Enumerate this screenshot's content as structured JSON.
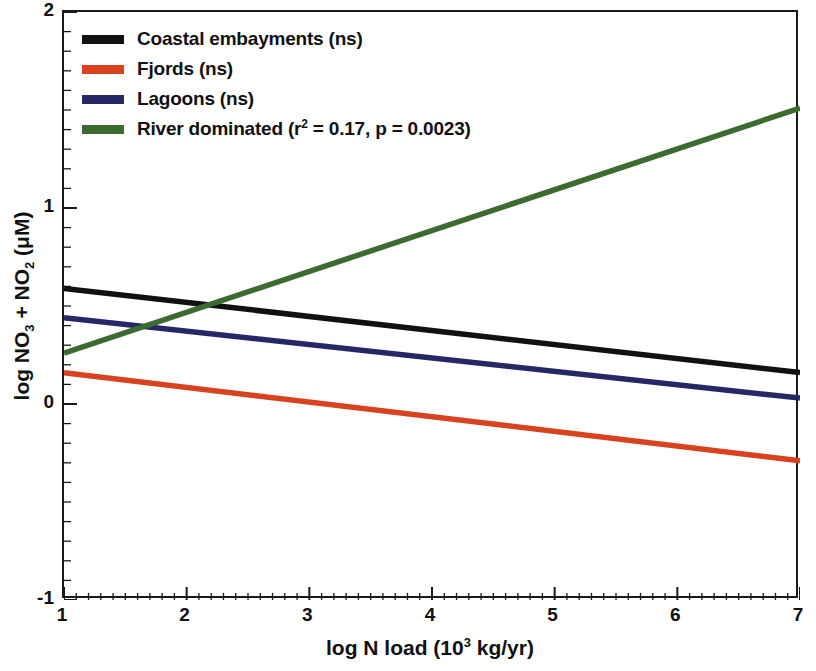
{
  "chart_data": {
    "type": "line",
    "title": "",
    "xlabel": "log N load (10^3 kg/yr)",
    "ylabel": "log NO3 + NO2 (uM)",
    "xlim": [
      1,
      7
    ],
    "ylim": [
      -1,
      2
    ],
    "xticks": [
      "1",
      "2",
      "3",
      "4",
      "5",
      "6",
      "7"
    ],
    "yticks": [
      "-1",
      "0",
      "1",
      "2"
    ],
    "xtick_values": [
      1,
      2,
      3,
      4,
      5,
      6,
      7
    ],
    "ytick_values": [
      -1,
      0,
      1,
      2
    ],
    "grid": false,
    "legend_position": "top-left",
    "minor_ticks_per_major_x": 10,
    "minor_ticks_per_major_y": 10,
    "series": [
      {
        "name": "Coastal embayments (ns)",
        "color": "#111111",
        "x": [
          1,
          7
        ],
        "values": [
          0.59,
          0.16
        ],
        "slope": -0.0717,
        "intercept": 0.6617
      },
      {
        "name": "Fjords (ns)",
        "color": "#d8421f",
        "x": [
          1,
          7
        ],
        "values": [
          0.16,
          -0.29
        ],
        "slope": -0.075,
        "intercept": 0.235
      },
      {
        "name": "Lagoons (ns)",
        "color": "#272766",
        "x": [
          1,
          7
        ],
        "values": [
          0.44,
          0.03
        ],
        "slope": -0.0683,
        "intercept": 0.5083
      },
      {
        "name": "River dominated (r^2 = 0.17, p = 0.0023)",
        "color": "#3c6b30",
        "x": [
          1,
          7
        ],
        "values": [
          0.26,
          1.51
        ],
        "slope": 0.2083,
        "intercept": 0.0517
      }
    ]
  },
  "legend": {
    "items": [
      {
        "label": "Coastal embayments (ns)",
        "color": "#111111",
        "has_superscript": false,
        "text_before": "Coastal embayments (ns)",
        "superscript": "",
        "text_after": ""
      },
      {
        "label": "Fjords (ns)",
        "color": "#d8421f",
        "has_superscript": false,
        "text_before": "Fjords (ns)",
        "superscript": "",
        "text_after": ""
      },
      {
        "label": "Lagoons (ns)",
        "color": "#272766",
        "has_superscript": false,
        "text_before": "Lagoons (ns)",
        "superscript": "",
        "text_after": ""
      },
      {
        "label": "River dominated (r2 = 0.17, p = 0.0023)",
        "color": "#3c6b30",
        "has_superscript": true,
        "text_before": "River dominated (r",
        "superscript": "2",
        "text_after": " = 0.17, p = 0.0023)"
      }
    ]
  },
  "axes": {
    "y_title": {
      "part1": "log NO",
      "sub1": "3",
      "part2": " + NO",
      "sub2": "2",
      "part3": " (μM)"
    },
    "x_title": {
      "part1": "log N load (10",
      "sup1": "3",
      "part2": " kg/yr)"
    },
    "ytick_labels": [
      "2",
      "1",
      "0",
      "-1"
    ],
    "xtick_labels": [
      "1",
      "2",
      "3",
      "4",
      "5",
      "6",
      "7"
    ]
  },
  "colors": {
    "axis": "#1a1a1a",
    "background": "#ffffff",
    "black_series": "#111111",
    "red_series": "#d8421f",
    "blue_series": "#272766",
    "green_series": "#3c6b30"
  }
}
